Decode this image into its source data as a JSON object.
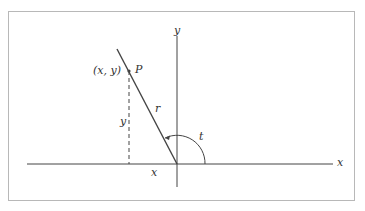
{
  "diagram": {
    "title": "",
    "type": "unit-angle coordinate diagram",
    "labels": {
      "x_axis": "x",
      "y_axis": "y",
      "point_name": "P",
      "point_coords": "(x, y)",
      "radius": "r",
      "vertical_leg": "y",
      "horizontal_leg": "x",
      "angle": "t"
    },
    "colors": {
      "line": "#444444",
      "frame": "#b8b8b8",
      "text": "#333333"
    }
  }
}
